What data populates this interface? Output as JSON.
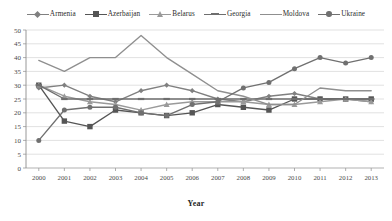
{
  "chart_data": {
    "type": "line",
    "title": "",
    "xlabel": "Year",
    "ylabel": "",
    "categories": [
      "2000",
      "2001",
      "2002",
      "2003",
      "2004",
      "2005",
      "2006",
      "2007",
      "2008",
      "2009",
      "2010",
      "2011",
      "2012",
      "2013"
    ],
    "ylim": [
      0,
      50
    ],
    "ytick_step": 5,
    "yticks": [
      "0",
      "5",
      "10",
      "15",
      "20",
      "25",
      "30",
      "35",
      "40",
      "45",
      "50"
    ],
    "grid": true,
    "legend_position": "top",
    "series": [
      {
        "name": "Armenia",
        "color": "#808080",
        "marker": "diamond",
        "values": [
          29,
          30,
          26,
          24,
          28,
          30,
          28,
          25,
          24,
          26,
          27,
          25,
          25,
          24
        ]
      },
      {
        "name": "Azerbaijan",
        "color": "#555555",
        "marker": "square",
        "values": [
          30,
          17,
          15,
          21,
          20,
          19,
          20,
          23,
          22,
          21,
          25,
          25,
          25,
          25
        ]
      },
      {
        "name": "Belarus",
        "color": "#9a9a9a",
        "marker": "triangle",
        "values": [
          30,
          26,
          24,
          23,
          21,
          23,
          24,
          24,
          24,
          23,
          23,
          24,
          25,
          24
        ]
      },
      {
        "name": "Georgia",
        "color": "#6e6e6e",
        "marker": "dash",
        "values": [
          30,
          25,
          25,
          25,
          25,
          25,
          25,
          25,
          25,
          25,
          25,
          25,
          25,
          25
        ]
      },
      {
        "name": "Moldova",
        "color": "#8f8f8f",
        "marker": "none",
        "values": [
          39,
          35,
          40,
          40,
          48,
          40,
          34,
          28,
          26,
          23,
          23,
          29,
          28,
          28
        ]
      },
      {
        "name": "Ukraine",
        "color": "#707070",
        "marker": "circle",
        "values": [
          10,
          21,
          22,
          22,
          20,
          19,
          23,
          24,
          29,
          31,
          36,
          40,
          38,
          40
        ]
      }
    ]
  },
  "axis": {
    "x_title": "Year"
  }
}
